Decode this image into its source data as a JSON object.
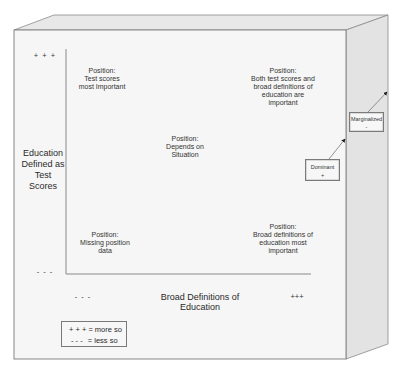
{
  "diagram": {
    "type": "2x2 quadrant cube",
    "y_axis": {
      "title": "Education Defined as Test Scores",
      "title_lines": [
        "Education",
        "Defined as",
        "Test",
        "Scores"
      ],
      "high_mark": "+ + +",
      "low_mark": "- - -"
    },
    "x_axis": {
      "title": "Broad Definitions of Education",
      "low_mark": "- - -",
      "high_mark": "+++"
    },
    "positions": {
      "top_left": {
        "lines": [
          "Position:",
          "Test scores",
          "most Important"
        ]
      },
      "top_right": {
        "lines": [
          "Position:",
          "Both test scores and",
          "broad definitions of",
          "education are",
          "important"
        ]
      },
      "center": {
        "lines": [
          "Position:",
          "Depends on",
          "Situation"
        ]
      },
      "bottom_left": {
        "lines": [
          "Position:",
          "Missing position",
          "data"
        ]
      },
      "bottom_right": {
        "lines": [
          "Position:",
          "Broad definitions of",
          "education most",
          "important"
        ]
      }
    },
    "depth_boxes": {
      "dominant": {
        "label": "Dominant",
        "sign": "+"
      },
      "marginalized": {
        "label": "Marginalized",
        "sign": "-"
      }
    },
    "legend": {
      "items": [
        {
          "symbol": "+ + +",
          "text": "= more so"
        },
        {
          "symbol": "- - -",
          "text": "= less so"
        }
      ]
    },
    "colors": {
      "front_face": "#f5f5f5",
      "top_face": "#e6e6e6",
      "side_face": "#e2e2e2",
      "edge": "#7f7f7f",
      "axis": "#8a8a8a"
    }
  }
}
